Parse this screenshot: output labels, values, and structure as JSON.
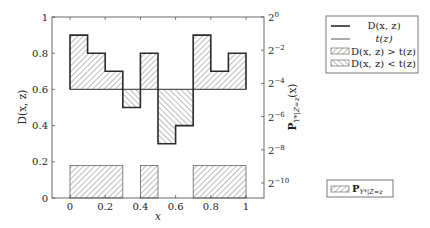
{
  "chart_data": {
    "type": "bar",
    "title": "",
    "xlabel": "x",
    "ylabel": "D(x, z)",
    "ylabel_right": "P_{Y*|Z=z}(x)",
    "xlim": [
      -0.05,
      1.05
    ],
    "ylim": [
      0,
      1
    ],
    "x_ticks": [
      0,
      0.2,
      0.4,
      0.6,
      0.8,
      1
    ],
    "x_tick_labels": [
      "0",
      "0.2",
      "0.4",
      "0.6",
      "0.8",
      "1"
    ],
    "y_ticks": [
      0,
      0.2,
      0.4,
      0.6,
      0.8,
      1
    ],
    "y_tick_labels": [
      "0",
      "0.2",
      "0.4",
      "0.6",
      "0.8",
      "1"
    ],
    "y_right_ticks_exponent": [
      0,
      -2,
      -4,
      -6,
      -8,
      -10
    ],
    "y_right_tick_labels": [
      "2^0",
      "2^-2",
      "2^-4",
      "2^-6",
      "2^-8",
      "2^-10"
    ],
    "grid": false,
    "bins": [
      [
        0.0,
        0.1
      ],
      [
        0.1,
        0.2
      ],
      [
        0.2,
        0.3
      ],
      [
        0.3,
        0.4
      ],
      [
        0.4,
        0.5
      ],
      [
        0.5,
        0.6
      ],
      [
        0.6,
        0.7
      ],
      [
        0.7,
        0.8
      ],
      [
        0.8,
        0.9
      ],
      [
        0.9,
        1.0
      ]
    ],
    "series": [
      {
        "name": "D(x, z)",
        "kind": "step",
        "values": [
          0.9,
          0.8,
          0.7,
          0.5,
          0.8,
          0.3,
          0.4,
          0.9,
          0.7,
          0.8
        ]
      },
      {
        "name": "t(z)",
        "kind": "hline",
        "value": 0.6
      },
      {
        "name": "P_{Y*|Z=z}",
        "kind": "bar",
        "values": [
          0.18,
          0.18,
          0.18,
          0,
          0.18,
          0,
          0,
          0.18,
          0.18,
          0.18
        ]
      }
    ],
    "fill_regions": {
      "above": "D(x, z) > t(z)",
      "below": "D(x, z) < t(z)"
    },
    "legend": {
      "position": "right",
      "entries": [
        "D(x, z)",
        "t(z)",
        "D(x, z) > t(z)",
        "D(x, z) < t(z)"
      ],
      "secondary_entries": [
        "P_{Y*|Z=z}"
      ]
    },
    "colors": {
      "d_line": "#2a2a2a",
      "t_line": "#555555",
      "hatch": "#777777",
      "frame": "#444444"
    }
  },
  "legend": {
    "d_line": "D(x, z)",
    "t_line": "t(z)",
    "above": "D(x, z) > t(z)",
    "below": "D(x, z) < t(z)",
    "p_main": "P",
    "p_sub": "Y*|Z=z"
  },
  "axes": {
    "xlabel": "x",
    "ylabel": "D(x, z)",
    "ylabel_right_main": "P",
    "ylabel_right_sub": "Y*|Z=z",
    "ylabel_right_tail": "(x)"
  }
}
